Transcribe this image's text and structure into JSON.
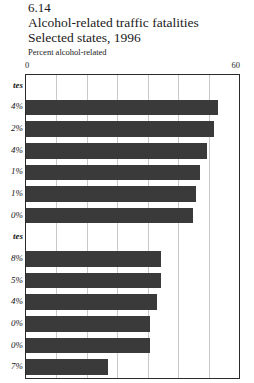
{
  "figure": {
    "number": "6.14",
    "title_line1": "Alcohol-related traffic fatalities",
    "title_line2": "Selected states, 1996",
    "subtitle": "Percent alcohol-related"
  },
  "axis": {
    "min_label": "0",
    "max_label": "60"
  },
  "chart_data": {
    "type": "bar",
    "orientation": "horizontal",
    "title": "Alcohol-related traffic fatalities",
    "subtitle": "Selected states, 1996",
    "xlabel": "Percent alcohol-related",
    "ylabel": "",
    "xlim": [
      0,
      60
    ],
    "xticks": [
      0,
      60
    ],
    "xtick_labels": [
      "0",
      "60"
    ],
    "gridlines": 6,
    "grid": true,
    "legend": "none",
    "bar_color": "#3a3a3a",
    "note": "Category labels are clipped at the left edge of the screenshot; only trailing characters are legible.",
    "groups": [
      {
        "header_visible_text": "tes",
        "header_note": "italic bold group heading, left-truncated (ends in 'tes', i.e. '...states')",
        "categories": [
          "4%",
          "2%",
          "4%",
          "1%",
          "1%",
          "0%"
        ],
        "values": [
          54,
          53,
          51,
          49,
          48,
          47
        ]
      },
      {
        "header_visible_text": "tes",
        "header_note": "italic bold group heading, left-truncated (ends in 'tes', i.e. '...states')",
        "categories": [
          "8%",
          "5%",
          "4%",
          "0%",
          "0%",
          "7%"
        ],
        "values": [
          38,
          38,
          37,
          35,
          35,
          23
        ]
      }
    ]
  }
}
